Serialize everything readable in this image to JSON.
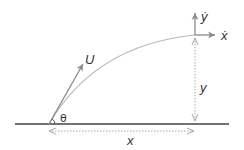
{
  "diagram": {
    "type": "projectile-motion",
    "labels": {
      "velocity": "U",
      "angle": "θ",
      "x_velocity": "ẋ",
      "y_velocity": "ẏ",
      "height": "y",
      "distance": "x"
    },
    "colors": {
      "ground": "#444444",
      "arrows": "#8a8a8a",
      "trajectory": "#b8b8b8",
      "dimension": "#a8a8a8",
      "text": "#333333"
    }
  }
}
